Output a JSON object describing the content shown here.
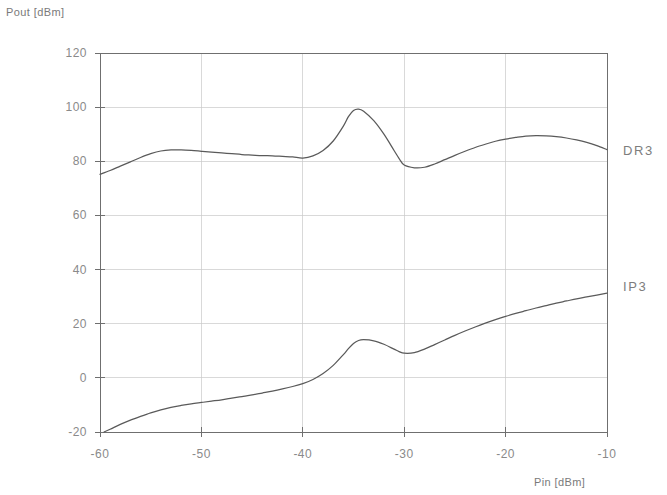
{
  "chart_data": {
    "type": "line",
    "title": "",
    "xlabel": "Pin [dBm]",
    "ylabel": "Pout [dBm]",
    "xlim": [
      -60,
      -10
    ],
    "ylim": [
      -20,
      120
    ],
    "xticks": [
      -60,
      -50,
      -40,
      -30,
      -20,
      -10
    ],
    "xtick_labels": [
      "-60",
      "-50",
      "-40",
      "-30",
      "-20",
      "-10"
    ],
    "yticks": [
      -20,
      0,
      20,
      40,
      60,
      80,
      100,
      120
    ],
    "ytick_labels": [
      "-20",
      "0",
      "20",
      "40",
      "60",
      "80",
      "100",
      "120"
    ],
    "grid": true,
    "grid_color": "#c9c9c9",
    "axis_color": "#6f6f6f",
    "curve_color": "#5a5a5a",
    "legend_position": "right-inline",
    "series": [
      {
        "name": "DR3",
        "label": "DR3",
        "label_x": -9.2,
        "label_y": 84,
        "x": [
          -60.0,
          -59.0,
          -58.0,
          -57.0,
          -56.0,
          -55.0,
          -54.0,
          -53.0,
          -52.0,
          -51.0,
          -50.0,
          -49.0,
          -48.0,
          -47.0,
          -46.0,
          -45.0,
          -44.0,
          -43.0,
          -42.0,
          -41.0,
          -40.0,
          -39.0,
          -38.0,
          -37.0,
          -36.0,
          -35.5,
          -35.0,
          -34.5,
          -34.0,
          -33.0,
          -32.0,
          -31.0,
          -30.5,
          -30.0,
          -29.0,
          -28.0,
          -27.0,
          -26.0,
          -25.0,
          -24.0,
          -23.0,
          -22.0,
          -21.0,
          -20.0,
          -19.0,
          -18.0,
          -17.0,
          -16.0,
          -15.0,
          -14.0,
          -13.0,
          -12.0,
          -11.0,
          -10.0
        ],
        "y": [
          75.2,
          76.6,
          78.2,
          79.8,
          81.4,
          82.8,
          83.8,
          84.2,
          84.2,
          84.0,
          83.7,
          83.4,
          83.1,
          82.8,
          82.5,
          82.3,
          82.1,
          82.0,
          81.8,
          81.6,
          81.2,
          82.0,
          84.0,
          87.5,
          93.0,
          96.5,
          98.8,
          99.3,
          98.5,
          95.0,
          90.0,
          84.0,
          81.0,
          78.6,
          77.6,
          77.8,
          79.0,
          80.6,
          82.2,
          83.7,
          85.1,
          86.3,
          87.4,
          88.2,
          88.8,
          89.3,
          89.5,
          89.4,
          89.1,
          88.6,
          87.9,
          87.0,
          85.8,
          84.3
        ]
      },
      {
        "name": "IP3",
        "label": "IP3",
        "label_x": -9.2,
        "label_y": 34,
        "x": [
          -59.6,
          -59.0,
          -58.0,
          -57.0,
          -56.0,
          -55.0,
          -54.0,
          -53.0,
          -52.0,
          -51.0,
          -50.0,
          -49.0,
          -48.0,
          -47.0,
          -46.0,
          -45.0,
          -44.0,
          -43.0,
          -42.0,
          -41.0,
          -40.0,
          -39.0,
          -38.0,
          -37.0,
          -36.0,
          -35.5,
          -35.0,
          -34.5,
          -34.0,
          -33.0,
          -32.0,
          -31.0,
          -30.5,
          -30.0,
          -29.0,
          -28.0,
          -27.0,
          -26.0,
          -25.0,
          -24.0,
          -23.0,
          -22.0,
          -21.0,
          -20.0,
          -19.0,
          -18.0,
          -17.0,
          -16.0,
          -15.0,
          -14.0,
          -13.0,
          -12.0,
          -11.0,
          -10.0
        ],
        "y": [
          -20.0,
          -19.0,
          -17.2,
          -15.6,
          -14.2,
          -12.9,
          -11.8,
          -10.9,
          -10.2,
          -9.6,
          -9.1,
          -8.6,
          -8.1,
          -7.5,
          -6.9,
          -6.3,
          -5.6,
          -4.9,
          -4.1,
          -3.2,
          -2.1,
          -0.6,
          1.6,
          4.6,
          8.6,
          10.8,
          12.7,
          13.8,
          14.1,
          13.7,
          12.4,
          10.6,
          9.7,
          9.1,
          9.3,
          10.6,
          12.3,
          14.0,
          15.7,
          17.3,
          18.8,
          20.2,
          21.5,
          22.7,
          23.8,
          24.8,
          25.8,
          26.7,
          27.6,
          28.4,
          29.2,
          29.9,
          30.6,
          31.3
        ]
      }
    ]
  },
  "geometry": {
    "plot_left": 100,
    "plot_right": 607,
    "plot_top": 53,
    "plot_bottom": 432
  },
  "labels": {
    "ylabel_text": "Pout [dBm]",
    "xlabel_text": "Pin [dBm]"
  }
}
